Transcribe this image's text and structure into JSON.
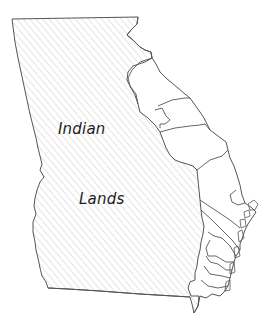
{
  "map": {
    "subject": "Georgia",
    "regions": [
      {
        "name": "indian-lands",
        "label_line1": "Indian",
        "label_line2": "Lands",
        "fill": "hatched"
      },
      {
        "name": "coastal-counties",
        "fill": "none"
      }
    ],
    "colors": {
      "outline": "#555555",
      "hatch": "#c8c8c8",
      "text": "#1e1e1e",
      "background": "#ffffff"
    }
  }
}
